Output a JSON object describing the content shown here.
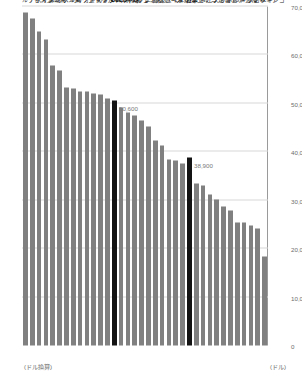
{
  "chart_data": {
    "type": "bar",
    "orientation": "horizontal-rotated",
    "title": "",
    "subtitle": "",
    "xlabel": "",
    "ylabel": "(ドル換算)",
    "unit_label": "(ドル)",
    "value_axis_label": "(ドル換算)",
    "ylim": [
      0,
      70000
    ],
    "axis_range": [
      0,
      70000
    ],
    "grid": true,
    "legend": "none",
    "tick_labels": [
      "0",
      "10,000",
      "20,000",
      "30,000",
      "40,000",
      "50,000",
      "60,000",
      "70,000"
    ],
    "ticks": [
      0,
      10000,
      20000,
      30000,
      40000,
      50000,
      60000,
      70000
    ],
    "categories": [
      "ルクセンブルク",
      "アイスランド",
      "スイス",
      "アメリカ",
      "デンマーク",
      "オランダ",
      "ベルギー",
      "ノルウェー",
      "オーストリア",
      "オーストラリア",
      "ドイツ",
      "カナダ",
      "アイルランド",
      "OECD平均",
      "イギリス",
      "フィンランド",
      "スウェーデン",
      "フランス",
      "ニュージーランド",
      "韓国",
      "スロベニア",
      "スペイン",
      "イタリア",
      "イスラエル",
      "日本",
      "リトアニア",
      "ポーランド",
      "エストニア",
      "チェコ",
      "ラトビア",
      "ポルトガル",
      "ハンガリー",
      "ギリシャ",
      "スロバキア",
      "チリ",
      "メキシコ"
    ],
    "values": [
      68700,
      67500,
      64800,
      63100,
      57800,
      56700,
      53200,
      53000,
      52500,
      52400,
      52000,
      51900,
      50900,
      50600,
      49100,
      48100,
      47500,
      46500,
      45300,
      42300,
      41400,
      38400,
      38100,
      37600,
      38900,
      33500,
      33000,
      31100,
      30100,
      28800,
      27800,
      25400,
      25300,
      24800,
      24200,
      18300
    ],
    "highlighted": [
      "OECD平均",
      "日本"
    ],
    "highlight_color": "#141414",
    "bar_color": "#808080",
    "data_labels": [
      {
        "category": "OECD平均",
        "text": "50,600"
      },
      {
        "category": "日本",
        "text": "38,900"
      }
    ]
  }
}
